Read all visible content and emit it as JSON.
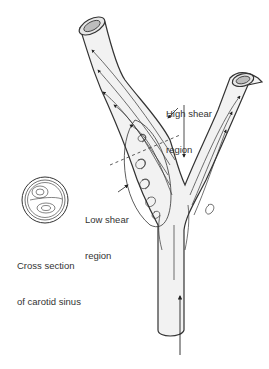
{
  "diagram": {
    "labels": {
      "high_shear_line1": "High shear",
      "high_shear_line2": "region",
      "low_shear_line1": "Low shear",
      "low_shear_line2": "region",
      "cross_section_line1": "Cross section",
      "cross_section_line2": "of carotid sinus"
    },
    "colors": {
      "vessel_fill": "#f2f2f2",
      "vessel_stroke": "#333333",
      "inner_lumen": "#bdbdbd",
      "text": "#333333"
    }
  }
}
